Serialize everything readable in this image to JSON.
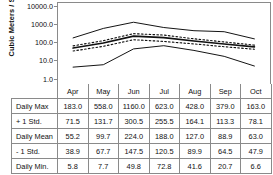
{
  "chart_data": {
    "type": "line",
    "title": "",
    "xlabel": "",
    "ylabel": "Cubic Meters / Second",
    "yscale": "log",
    "ylim": [
      1.0,
      10000.0
    ],
    "yticks": [
      "1.0",
      "10.0",
      "100.0",
      "1000.0",
      "10000.0"
    ],
    "grid": false,
    "legend": "none (values shown in table below)",
    "categories": [
      "Apr",
      "May",
      "Jun",
      "Jul",
      "Aug",
      "Sep",
      "Oct"
    ],
    "series": [
      {
        "name": "Daily Max",
        "style": "solid-thin",
        "values": [
          183.0,
          558.0,
          1160.0,
          623.0,
          428.0,
          379.0,
          163.0
        ]
      },
      {
        "name": "+ 1 Std.",
        "style": "dotted",
        "values": [
          71.5,
          131.7,
          300.5,
          255.5,
          164.1,
          113.3,
          78.1
        ]
      },
      {
        "name": "Daily Mean",
        "style": "solid-thick",
        "values": [
          55.2,
          99.7,
          224.0,
          188.0,
          127.0,
          88.9,
          63.0
        ]
      },
      {
        "name": "- 1 Std.",
        "style": "dotted",
        "values": [
          38.9,
          67.7,
          147.5,
          120.5,
          89.9,
          64.5,
          47.9
        ]
      },
      {
        "name": "Daily Min.",
        "style": "solid-thin",
        "values": [
          5.8,
          7.7,
          49.8,
          72.8,
          41.6,
          20.7,
          6.6
        ]
      }
    ]
  },
  "axis": {
    "title": "Cubic Meters / Second",
    "tick_10000": "10000.0",
    "tick_1000": "1000.0",
    "tick_100": "100.0",
    "tick_10": "10.0",
    "tick_1": "1.0"
  },
  "table": {
    "corner": "",
    "columns": [
      "Apr",
      "May",
      "Jun",
      "Jul",
      "Aug",
      "Sep",
      "Oct"
    ],
    "rows": [
      {
        "label": "Daily Max",
        "cells": [
          "183.0",
          "558.0",
          "1160.0",
          "623.0",
          "428.0",
          "379.0",
          "163.0"
        ]
      },
      {
        "label": "+ 1 Std.",
        "cells": [
          "71.5",
          "131.7",
          "300.5",
          "255.5",
          "164.1",
          "113.3",
          "78.1"
        ]
      },
      {
        "label": "Daily Mean",
        "cells": [
          "55.2",
          "99.7",
          "224.0",
          "188.0",
          "127.0",
          "88.9",
          "63.0"
        ]
      },
      {
        "label": "- 1 Std.",
        "cells": [
          "38.9",
          "67.7",
          "147.5",
          "120.5",
          "89.9",
          "64.5",
          "47.9"
        ]
      },
      {
        "label": "Daily Min.",
        "cells": [
          "5.8",
          "7.7",
          "49.8",
          "72.8",
          "41.6",
          "20.7",
          "6.6"
        ]
      }
    ]
  },
  "colors": {
    "line": "#111111",
    "border": "#8a8a8a",
    "background": "#ffffff",
    "text": "#111111"
  }
}
